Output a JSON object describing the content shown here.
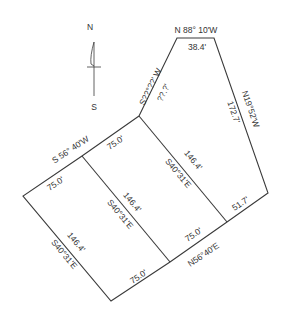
{
  "compass": {
    "north_label": "N",
    "south_label": "S"
  },
  "boundary": {
    "top_bearing": "N 88° 10'W",
    "top_distance": "38.4'",
    "upper_left_bearing": "S??°??' W",
    "upper_left_distance": "??.?'",
    "right_bearing": "N19°52'W",
    "right_distance": "172.7'",
    "left_front_bearing": "S 56° 40'W",
    "rear_bearing": "N56°40'E"
  },
  "lots": [
    {
      "name": "left-lot",
      "front_distance": "75.0'",
      "rear_distance": "75.0'",
      "side_distance": "146.4'",
      "side_bearing": "S40°31'E"
    },
    {
      "name": "middle-lot",
      "front_distance": "75.0'",
      "rear_distance": "75.0'",
      "side_distance": "146.4'",
      "side_bearing": "S40°31'E"
    },
    {
      "name": "right-lot",
      "side_distance": "146.4'",
      "side_bearing": "S40°31'E",
      "rear_distance": "51.7'"
    }
  ],
  "colors": {
    "line": "#3a3a3a",
    "text": "#333333",
    "background": "#ffffff"
  }
}
